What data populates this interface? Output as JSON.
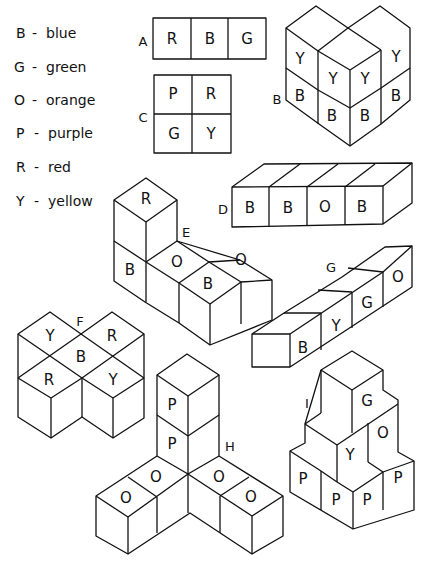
{
  "legend": {
    "items": [
      {
        "code": "B",
        "sep": "-",
        "color": "blue"
      },
      {
        "code": "G",
        "sep": "-",
        "color": "green"
      },
      {
        "code": "O",
        "sep": "-",
        "color": "orange"
      },
      {
        "code": "P",
        "sep": "-",
        "color": "purple"
      },
      {
        "code": "R",
        "sep": "-",
        "color": "red"
      },
      {
        "code": "Y",
        "sep": "-",
        "color": "yellow"
      }
    ]
  },
  "figures": {
    "A": {
      "label": "A",
      "faces": [
        "R",
        "B",
        "G"
      ]
    },
    "B": {
      "label": "B",
      "faces": [
        "Y",
        "Y",
        "Y",
        "Y",
        "B",
        "B",
        "B",
        "B"
      ]
    },
    "C": {
      "label": "C",
      "faces": [
        "P",
        "R",
        "G",
        "Y"
      ]
    },
    "D": {
      "label": "D",
      "faces": [
        "B",
        "B",
        "O",
        "B"
      ]
    },
    "E": {
      "label": "E",
      "faces": [
        "R",
        "B",
        "O",
        "O",
        "B"
      ]
    },
    "F": {
      "label": "F",
      "faces": [
        "Y",
        "R",
        "B",
        "R",
        "Y"
      ]
    },
    "G": {
      "label": "G",
      "faces": [
        "B",
        "Y",
        "G",
        "O"
      ]
    },
    "H": {
      "label": "H",
      "faces": [
        "P",
        "P",
        "O",
        "O",
        "O",
        "O"
      ]
    },
    "I": {
      "label": "I",
      "faces": [
        "G",
        "O",
        "Y",
        "P",
        "P",
        "P",
        "P"
      ]
    }
  }
}
